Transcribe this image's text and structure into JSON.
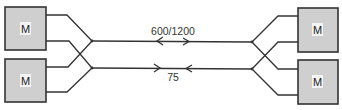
{
  "diagram": {
    "modem_label": "M",
    "modems": [
      {
        "side": "left",
        "label": "M"
      },
      {
        "side": "left",
        "label": "M"
      },
      {
        "side": "right",
        "label": "M"
      },
      {
        "side": "right",
        "label": "M"
      }
    ],
    "channels": [
      {
        "label": "600/1200",
        "direction": "forward (left to right)"
      },
      {
        "label": "75",
        "direction": "reverse (right to left)"
      }
    ],
    "colors": {
      "box_fill": "#cfcfcf",
      "line": "#333333"
    }
  }
}
